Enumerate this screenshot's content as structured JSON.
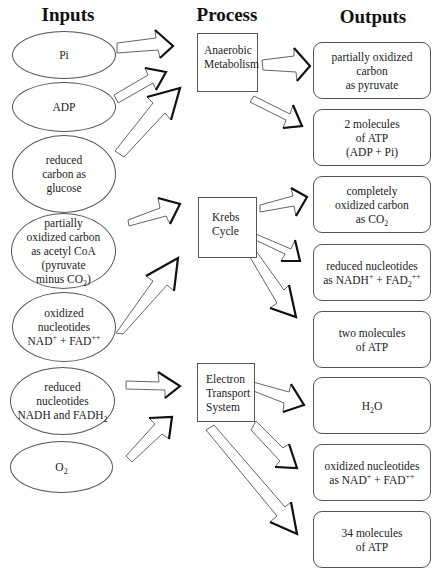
{
  "headers": {
    "inputs": "Inputs",
    "process": "Process",
    "outputs": "Outputs"
  },
  "inputs": [
    {
      "id": "pi",
      "label": "Pi"
    },
    {
      "id": "adp",
      "label": "ADP"
    },
    {
      "id": "glucose",
      "label": "reduced\ncarbon as\nglucose"
    },
    {
      "id": "acetyl-coa",
      "line1": "partially",
      "line2": "oxidized carbon",
      "line3": "as acetyl CoA",
      "line4": "(pyruvate",
      "line5_pre": "minus CO",
      "line5_sub": "2",
      "line5_post": ")"
    },
    {
      "id": "oxidized-nucleotides",
      "line1": "oxidized",
      "line2": "nucleotides",
      "line3_a": "NAD",
      "line3_a_sup": "+",
      "line3_mid": " + FAD",
      "line3_b_sup": "++"
    },
    {
      "id": "reduced-nucleotides",
      "line1": "reduced",
      "line2": "nucleotides",
      "line3_pre": "NADH and FADH",
      "line3_sub": "2"
    },
    {
      "id": "oxygen",
      "pre": "O",
      "sub": "2"
    }
  ],
  "processes": [
    {
      "id": "anaerobic-metabolism",
      "label": "Anaerobic\nMetabolism"
    },
    {
      "id": "krebs-cycle",
      "label": "Krebs\nCycle"
    },
    {
      "id": "electron-transport-system",
      "label": "Electron\nTransport\nSystem"
    }
  ],
  "outputs": [
    {
      "id": "pyruvate",
      "label": "partially oxidized\ncarbon\nas pyruvate"
    },
    {
      "id": "atp-2",
      "label": "2 molecules\nof ATP\n(ADP + Pi)"
    },
    {
      "id": "co2",
      "line1": "completely",
      "line2": "oxidized carbon",
      "line3_pre": "as CO",
      "line3_sub": "2"
    },
    {
      "id": "reduced-nucleotides-out",
      "line1": "reduced nucleotides",
      "line2_a": "as NADH",
      "line2_a_sup": "+",
      "line2_mid": " + FAD",
      "line2_sub": "2",
      "line2_b_sup": "++"
    },
    {
      "id": "atp-two",
      "label": "two molecules\nof ATP"
    },
    {
      "id": "water",
      "pre": "H",
      "sub": "2",
      "post": "O"
    },
    {
      "id": "oxidized-nucleotides-out",
      "line1": "oxidized nucleotides",
      "line2_a": "as NAD",
      "line2_a_sup": "+",
      "line2_mid": " + FAD",
      "line2_b_sup": "++"
    },
    {
      "id": "atp-34",
      "label": "34 molecules\nof ATP"
    }
  ],
  "colors": {
    "stroke": "#555555",
    "arrow_dark": "#111111",
    "text": "#222222",
    "background": "#ffffff"
  }
}
